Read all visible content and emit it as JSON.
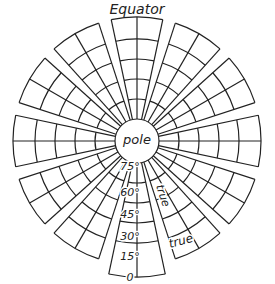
{
  "title": "Equator",
  "center_label": "pole",
  "latitude_labels": [
    "75°",
    "60°",
    "45°",
    "30°",
    "15°",
    "0"
  ],
  "annotations": [
    "true",
    "true"
  ],
  "gores": {
    "count": 12,
    "cells_across": 2,
    "rings": 5
  },
  "colors": {
    "line": "#222222",
    "background": "#ffffff"
  }
}
